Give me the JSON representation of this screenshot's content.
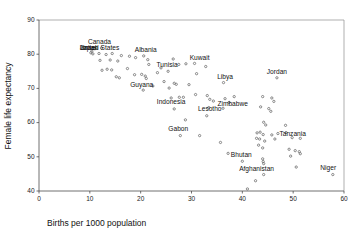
{
  "chart_data": {
    "type": "scatter",
    "title": "",
    "xlabel": "Births per 1000 population",
    "ylabel": "Female life expectancy",
    "xlim": [
      0,
      60
    ],
    "ylim": [
      40,
      90
    ],
    "xticks": [
      0,
      10,
      20,
      30,
      40,
      50,
      60
    ],
    "yticks": [
      40,
      50,
      60,
      70,
      80,
      90
    ],
    "grid": false,
    "legend": false,
    "marker": "open-circle",
    "points": [
      {
        "x": 11.0,
        "y": 81.6,
        "label": "Canada"
      },
      {
        "x": 12.3,
        "y": 81.8,
        "label": ""
      },
      {
        "x": 10.4,
        "y": 80.9,
        "label": "United States"
      },
      {
        "x": 10.2,
        "y": 80.4,
        "label": "Japan"
      },
      {
        "x": 10.6,
        "y": 80.1,
        "label": "Israel"
      },
      {
        "x": 11.8,
        "y": 80.2,
        "label": ""
      },
      {
        "x": 13.2,
        "y": 79.9,
        "label": ""
      },
      {
        "x": 14.4,
        "y": 80.2,
        "label": ""
      },
      {
        "x": 16.2,
        "y": 79.6,
        "label": ""
      },
      {
        "x": 17.8,
        "y": 79.4,
        "label": ""
      },
      {
        "x": 12.0,
        "y": 78.2,
        "label": ""
      },
      {
        "x": 14.0,
        "y": 78.3,
        "label": ""
      },
      {
        "x": 15.5,
        "y": 78.0,
        "label": ""
      },
      {
        "x": 19.0,
        "y": 79.0,
        "label": ""
      },
      {
        "x": 20.6,
        "y": 79.5,
        "label": "Albania"
      },
      {
        "x": 21.4,
        "y": 78.4,
        "label": ""
      },
      {
        "x": 12.4,
        "y": 75.3,
        "label": ""
      },
      {
        "x": 13.4,
        "y": 75.6,
        "label": ""
      },
      {
        "x": 14.3,
        "y": 75.4,
        "label": ""
      },
      {
        "x": 15.2,
        "y": 73.4,
        "label": ""
      },
      {
        "x": 15.8,
        "y": 73.1,
        "label": ""
      },
      {
        "x": 17.4,
        "y": 75.8,
        "label": ""
      },
      {
        "x": 18.8,
        "y": 74.0,
        "label": ""
      },
      {
        "x": 20.2,
        "y": 74.1,
        "label": ""
      },
      {
        "x": 20.9,
        "y": 73.6,
        "label": ""
      },
      {
        "x": 21.1,
        "y": 72.9,
        "label": ""
      },
      {
        "x": 21.6,
        "y": 77.0,
        "label": ""
      },
      {
        "x": 23.3,
        "y": 74.6,
        "label": ""
      },
      {
        "x": 24.0,
        "y": 76.0,
        "label": "Tunisia"
      },
      {
        "x": 25.4,
        "y": 75.0,
        "label": ""
      },
      {
        "x": 26.4,
        "y": 78.6,
        "label": ""
      },
      {
        "x": 27.5,
        "y": 77.0,
        "label": ""
      },
      {
        "x": 28.9,
        "y": 77.2,
        "label": ""
      },
      {
        "x": 30.6,
        "y": 77.3,
        "label": "Kuwait"
      },
      {
        "x": 31.0,
        "y": 74.3,
        "label": ""
      },
      {
        "x": 32.8,
        "y": 76.4,
        "label": ""
      },
      {
        "x": 46.8,
        "y": 73.1,
        "label": "Jordan"
      },
      {
        "x": 36.3,
        "y": 71.7,
        "label": "Libya"
      },
      {
        "x": 20.5,
        "y": 69.5,
        "label": "Guyana"
      },
      {
        "x": 22.4,
        "y": 70.7,
        "label": ""
      },
      {
        "x": 24.6,
        "y": 72.0,
        "label": ""
      },
      {
        "x": 25.6,
        "y": 70.1,
        "label": ""
      },
      {
        "x": 26.6,
        "y": 71.5,
        "label": ""
      },
      {
        "x": 27.0,
        "y": 71.2,
        "label": ""
      },
      {
        "x": 29.5,
        "y": 71.1,
        "label": ""
      },
      {
        "x": 26.0,
        "y": 67.2,
        "label": ""
      },
      {
        "x": 27.6,
        "y": 67.4,
        "label": ""
      },
      {
        "x": 28.4,
        "y": 67.4,
        "label": ""
      },
      {
        "x": 30.8,
        "y": 68.2,
        "label": ""
      },
      {
        "x": 33.1,
        "y": 67.9,
        "label": ""
      },
      {
        "x": 33.6,
        "y": 66.8,
        "label": ""
      },
      {
        "x": 34.3,
        "y": 66.3,
        "label": ""
      },
      {
        "x": 36.6,
        "y": 67.0,
        "label": ""
      },
      {
        "x": 38.4,
        "y": 67.6,
        "label": ""
      },
      {
        "x": 44.0,
        "y": 67.6,
        "label": ""
      },
      {
        "x": 45.8,
        "y": 67.2,
        "label": ""
      },
      {
        "x": 46.2,
        "y": 66.2,
        "label": ""
      },
      {
        "x": 26.6,
        "y": 64.0,
        "label": "Indonesia"
      },
      {
        "x": 33.4,
        "y": 64.4,
        "label": "Lesotho"
      },
      {
        "x": 36.2,
        "y": 64.2,
        "label": ""
      },
      {
        "x": 37.4,
        "y": 65.9,
        "label": "Zimbabwe"
      },
      {
        "x": 43.6,
        "y": 64.6,
        "label": ""
      },
      {
        "x": 45.2,
        "y": 64.1,
        "label": ""
      },
      {
        "x": 45.6,
        "y": 63.3,
        "label": ""
      },
      {
        "x": 33.0,
        "y": 62.0,
        "label": ""
      },
      {
        "x": 28.8,
        "y": 60.8,
        "label": ""
      },
      {
        "x": 44.2,
        "y": 60.1,
        "label": ""
      },
      {
        "x": 44.6,
        "y": 59.3,
        "label": ""
      },
      {
        "x": 48.5,
        "y": 59.2,
        "label": ""
      },
      {
        "x": 27.8,
        "y": 56.2,
        "label": "Gabon"
      },
      {
        "x": 31.6,
        "y": 56.2,
        "label": ""
      },
      {
        "x": 42.9,
        "y": 57.0,
        "label": ""
      },
      {
        "x": 43.5,
        "y": 57.2,
        "label": ""
      },
      {
        "x": 44.1,
        "y": 56.5,
        "label": ""
      },
      {
        "x": 45.8,
        "y": 56.4,
        "label": ""
      },
      {
        "x": 47.0,
        "y": 56.8,
        "label": ""
      },
      {
        "x": 48.6,
        "y": 57.1,
        "label": "Tanzania"
      },
      {
        "x": 42.8,
        "y": 55.4,
        "label": ""
      },
      {
        "x": 43.4,
        "y": 55.2,
        "label": ""
      },
      {
        "x": 44.4,
        "y": 54.6,
        "label": ""
      },
      {
        "x": 46.4,
        "y": 55.2,
        "label": ""
      },
      {
        "x": 49.8,
        "y": 55.6,
        "label": ""
      },
      {
        "x": 51.4,
        "y": 55.4,
        "label": ""
      },
      {
        "x": 35.7,
        "y": 54.2,
        "label": ""
      },
      {
        "x": 43.2,
        "y": 53.4,
        "label": ""
      },
      {
        "x": 44.0,
        "y": 52.6,
        "label": ""
      },
      {
        "x": 49.2,
        "y": 52.2,
        "label": ""
      },
      {
        "x": 50.4,
        "y": 51.8,
        "label": ""
      },
      {
        "x": 51.2,
        "y": 51.5,
        "label": ""
      },
      {
        "x": 37.2,
        "y": 51.0,
        "label": ""
      },
      {
        "x": 44.0,
        "y": 49.4,
        "label": ""
      },
      {
        "x": 44.1,
        "y": 48.6,
        "label": ""
      },
      {
        "x": 44.2,
        "y": 48.0,
        "label": ""
      },
      {
        "x": 49.5,
        "y": 50.2,
        "label": ""
      },
      {
        "x": 51.4,
        "y": 50.9,
        "label": ""
      },
      {
        "x": 40.0,
        "y": 48.7,
        "label": "Bhutan"
      },
      {
        "x": 50.6,
        "y": 47.0,
        "label": ""
      },
      {
        "x": 57.8,
        "y": 44.8,
        "label": "Niger"
      },
      {
        "x": 44.2,
        "y": 44.8,
        "label": "Afghanistan"
      },
      {
        "x": 42.6,
        "y": 43.0,
        "label": ""
      },
      {
        "x": 41.0,
        "y": 40.6,
        "label": ""
      }
    ],
    "annotations": [
      {
        "text": "Canada",
        "x": 11.9,
        "y": 82.9
      },
      {
        "text": "United States",
        "x": 11.9,
        "y": 81.3
      },
      {
        "text": "Japan",
        "x": 9.8,
        "y": 81.3
      },
      {
        "text": "Israel",
        "x": 9.7,
        "y": 81.3
      },
      {
        "text": "Albania",
        "x": 21.0,
        "y": 80.6
      },
      {
        "text": "Tunisia",
        "x": 25.2,
        "y": 76.3
      },
      {
        "text": "Kuwait",
        "x": 31.6,
        "y": 78.3
      },
      {
        "text": "Libya",
        "x": 36.6,
        "y": 72.8
      },
      {
        "text": "Jordan",
        "x": 46.8,
        "y": 74.2
      },
      {
        "text": "Guyana",
        "x": 20.2,
        "y": 70.5
      },
      {
        "text": "Indonesia",
        "x": 26.0,
        "y": 65.4
      },
      {
        "text": "Lesotho",
        "x": 33.6,
        "y": 63.4
      },
      {
        "text": "Zimbabwe",
        "x": 38.1,
        "y": 64.9
      },
      {
        "text": "Gabon",
        "x": 27.4,
        "y": 57.4
      },
      {
        "text": "Tanzania",
        "x": 49.9,
        "y": 56.0
      },
      {
        "text": "Bhutan",
        "x": 39.8,
        "y": 49.8
      },
      {
        "text": "Afghanistan",
        "x": 42.8,
        "y": 45.9
      },
      {
        "text": "Niger",
        "x": 56.9,
        "y": 46.0
      }
    ]
  },
  "axes": {
    "x_title": "Births per 1000 population",
    "y_title": "Female life expectancy"
  }
}
